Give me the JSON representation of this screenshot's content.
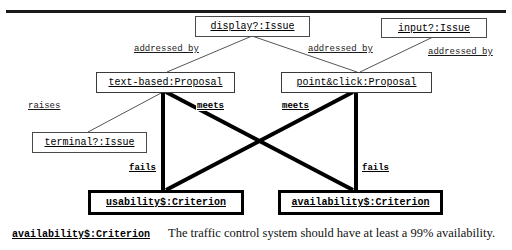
{
  "figure": {
    "type": "diagram",
    "notation": "issue-proposal-criterion argumentation diagram",
    "has_top_rule": true
  },
  "nodes": {
    "display_issue": {
      "label": "display?:Issue",
      "kind": "Issue"
    },
    "input_issue": {
      "label": "input?:Issue",
      "kind": "Issue"
    },
    "terminal_issue": {
      "label": "terminal?:Issue",
      "kind": "Issue"
    },
    "text_based_proposal": {
      "label": "text-based:Proposal",
      "kind": "Proposal"
    },
    "point_click_proposal": {
      "label": "point&click:Proposal",
      "kind": "Proposal"
    },
    "usability_criterion": {
      "label": "usability$:Criterion",
      "kind": "Criterion"
    },
    "availability_criterion": {
      "label": "availability$:Criterion",
      "kind": "Criterion"
    }
  },
  "edges": [
    {
      "label": "addressed by",
      "from": "display_issue",
      "to": "text_based_proposal",
      "weight": "thin"
    },
    {
      "label": "addressed by",
      "from": "display_issue",
      "to": "point_click_proposal",
      "weight": "thin"
    },
    {
      "label": "addressed by",
      "from": "input_issue",
      "to": "point_click_proposal",
      "weight": "thin"
    },
    {
      "label": "raises",
      "from": "text_based_proposal",
      "to": "terminal_issue",
      "weight": "thin"
    },
    {
      "label": "meets",
      "from": "text_based_proposal",
      "to": "usability_criterion",
      "weight": "thick"
    },
    {
      "label": "meets",
      "from": "point_click_proposal",
      "to": "availability_criterion",
      "weight": "thick"
    },
    {
      "label": "fails",
      "from": "text_based_proposal",
      "to": "availability_criterion",
      "weight": "thick"
    },
    {
      "label": "fails",
      "from": "point_click_proposal",
      "to": "usability_criterion",
      "weight": "thick"
    }
  ],
  "edge_labels": {
    "addressed_by_1": "addressed by",
    "addressed_by_2": "addressed by",
    "addressed_by_3": "addressed by",
    "raises": "raises",
    "meets_left": "meets",
    "meets_right": "meets",
    "fails_left": "fails",
    "fails_right": "fails"
  },
  "caption": {
    "term": "availability$:Criterion",
    "text": "The traffic control system should have at least a 99% availability."
  },
  "colors": {
    "line": "#000000",
    "thin_line": "#555555",
    "box_border": "#3a3a3a",
    "criterion_border": "#000000",
    "background": "#ffffff",
    "text": "#000000"
  }
}
